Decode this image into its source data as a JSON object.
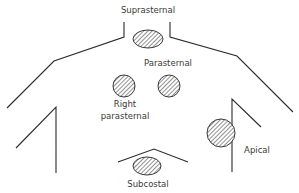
{
  "diagram": {
    "colors": {
      "line": "#2b2b2b",
      "hatch": "#555555",
      "label": "#3a3a3a",
      "background": "#ffffff"
    },
    "windows": [
      {
        "id": "suprasternal",
        "label": "Suprasternal",
        "shape": "ellipse",
        "cx": 148,
        "cy": 39,
        "rx": 15,
        "ry": 9
      },
      {
        "id": "right-parasternal",
        "label_line1": "Right",
        "label_line2": "parasternal",
        "shape": "circle",
        "cx": 124,
        "cy": 86,
        "r": 11
      },
      {
        "id": "parasternal",
        "label": "Parasternal",
        "shape": "circle",
        "cx": 169,
        "cy": 86,
        "r": 11
      },
      {
        "id": "apical",
        "label": "Apical",
        "shape": "circle",
        "cx": 221,
        "cy": 133,
        "r": 14
      },
      {
        "id": "subcostal",
        "label": "Subcostal",
        "shape": "ellipse",
        "cx": 147,
        "cy": 166,
        "rx": 14,
        "ry": 9
      }
    ],
    "labels": {
      "suprasternal": "Suprasternal",
      "parasternal": "Parasternal",
      "right_parasternal_1": "Right",
      "right_parasternal_2": "parasternal",
      "apical": "Apical",
      "subcostal": "Subcostal"
    }
  }
}
